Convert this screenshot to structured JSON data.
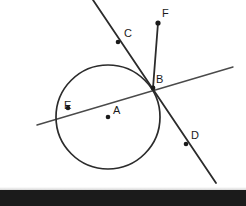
{
  "figure": {
    "background_color": "#ffffff",
    "stroke_color": "#2b2b2b",
    "label_color": "#1a1a1a",
    "width": 246,
    "height": 206
  },
  "circle": {
    "name": "circle-A",
    "center": {
      "x": 108,
      "y": 117
    },
    "radius": 52,
    "stroke_width": 1.6
  },
  "points": [
    {
      "id": "A",
      "label": "A",
      "x": 108,
      "y": 117,
      "label_x": 113,
      "label_y": 105,
      "role": "center",
      "dot": true
    },
    {
      "id": "B",
      "label": "B",
      "x": 153,
      "y": 88,
      "label_x": 156,
      "label_y": 74,
      "role": "on-circle-intersection",
      "dot": true
    },
    {
      "id": "C",
      "label": "C",
      "x": 118,
      "y": 42,
      "label_x": 124,
      "label_y": 28,
      "role": "on-line-CD",
      "dot": true
    },
    {
      "id": "D",
      "label": "D",
      "x": 186,
      "y": 144,
      "label_x": 191,
      "label_y": 130,
      "role": "on-line-CD",
      "dot": true
    },
    {
      "id": "E",
      "label": "E",
      "x": 68,
      "y": 108,
      "label_x": 64,
      "label_y": 100,
      "role": "on-circle-secant",
      "dot": true
    },
    {
      "id": "F",
      "label": "F",
      "x": 158,
      "y": 23,
      "label_x": 162,
      "label_y": 8,
      "role": "ray-endpoint",
      "dot": true
    }
  ],
  "lines": [
    {
      "name": "line-CD",
      "description": "secant line through C, B and D crossing the circle",
      "x1": 93,
      "y1": 0,
      "x2": 216,
      "y2": 183,
      "stroke_width": 1.7
    },
    {
      "name": "line-EB",
      "description": "secant line through E and B extended both directions",
      "x1": 37,
      "y1": 125,
      "x2": 233,
      "y2": 67,
      "stroke_width": 1.4
    },
    {
      "name": "segment-BF",
      "description": "segment from B up to F",
      "x1": 153,
      "y1": 88,
      "x2": 158,
      "y2": 23,
      "stroke_width": 1.7
    }
  ],
  "bottom_band": {
    "name": "cropped-caption-strip",
    "color": "#1b1b1b",
    "text": "",
    "note": "partially cropped dark strip at the bottom of the screenshot"
  }
}
